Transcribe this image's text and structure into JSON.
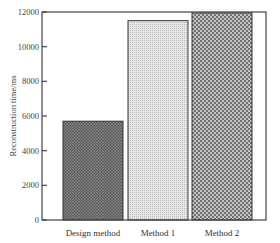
{
  "chart_data": {
    "type": "bar",
    "title": "",
    "xlabel": "",
    "ylabel": "Reconstruction time/ms",
    "categories": [
      "Design method",
      "Method 1",
      "Method 2"
    ],
    "values": [
      5700,
      11500,
      11950
    ],
    "ylim": [
      0,
      12000
    ],
    "yticks": [
      0,
      2000,
      4000,
      6000,
      8000,
      10000,
      12000
    ],
    "ytick_labels": [
      "0",
      "2000",
      "4000",
      "6000",
      "8000",
      "10000",
      "12000"
    ],
    "grid": false,
    "legend": null,
    "bar_patterns": [
      {
        "category": "Design method",
        "pattern": "dense dark dots",
        "fill": "#6e6e6e"
      },
      {
        "category": "Method 1",
        "pattern": "fine light dots",
        "fill": "#d6d6d6"
      },
      {
        "category": "Method 2",
        "pattern": "checkerboard",
        "fill": "#9a9a9a"
      }
    ]
  }
}
